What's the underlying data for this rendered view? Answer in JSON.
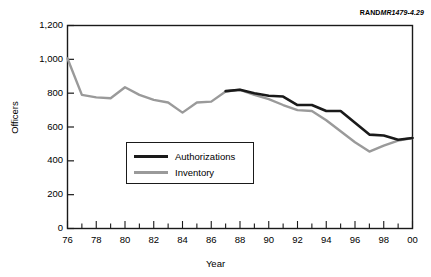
{
  "source_note": {
    "brand": "RAND",
    "identifier": "MR1479-4.29"
  },
  "axes": {
    "y_title": "Officers",
    "x_title": "Year"
  },
  "legend": {
    "items": [
      {
        "label": "Authorizations",
        "color": "#1a1a1a"
      },
      {
        "label": "Inventory",
        "color": "#9a9a9a"
      }
    ]
  },
  "chart_data": {
    "type": "line",
    "title": "",
    "subtitle": "",
    "xlabel": "Year",
    "ylabel": "Officers",
    "xlim": [
      1976,
      2000
    ],
    "ylim": [
      0,
      1200
    ],
    "grid": false,
    "legend_position": "inside-lower-left",
    "x_tick_labels": [
      "76",
      "78",
      "80",
      "82",
      "84",
      "86",
      "88",
      "90",
      "92",
      "94",
      "96",
      "98",
      "00"
    ],
    "x_tick_values": [
      1976,
      1978,
      1980,
      1982,
      1984,
      1986,
      1988,
      1990,
      1992,
      1994,
      1996,
      1998,
      2000
    ],
    "x_minor_tick_values": [
      1977,
      1979,
      1981,
      1983,
      1985,
      1987,
      1989,
      1991,
      1993,
      1995,
      1997,
      1999
    ],
    "y_tick_labels": [
      "0",
      "200",
      "400",
      "600",
      "800",
      "1,000",
      "1,200"
    ],
    "y_tick_values": [
      0,
      200,
      400,
      600,
      800,
      1000,
      1200
    ],
    "series": [
      {
        "name": "Inventory",
        "color": "#9a9a9a",
        "x": [
          1976,
          1977,
          1978,
          1979,
          1980,
          1981,
          1982,
          1983,
          1984,
          1985,
          1986,
          1987,
          1988,
          1989,
          1990,
          1991,
          1992,
          1993,
          1994,
          1995,
          1996,
          1997,
          1998,
          1999,
          2000
        ],
        "values": [
          1005,
          790,
          775,
          770,
          835,
          790,
          760,
          745,
          685,
          745,
          750,
          810,
          820,
          790,
          765,
          730,
          700,
          695,
          640,
          575,
          510,
          455,
          490,
          520,
          535
        ]
      },
      {
        "name": "Authorizations",
        "color": "#1a1a1a",
        "x": [
          1987,
          1988,
          1989,
          1990,
          1991,
          1992,
          1993,
          1994,
          1995,
          1996,
          1997,
          1998,
          1999,
          2000
        ],
        "values": [
          812,
          820,
          800,
          785,
          780,
          730,
          730,
          695,
          695,
          625,
          555,
          550,
          525,
          535
        ]
      }
    ]
  }
}
